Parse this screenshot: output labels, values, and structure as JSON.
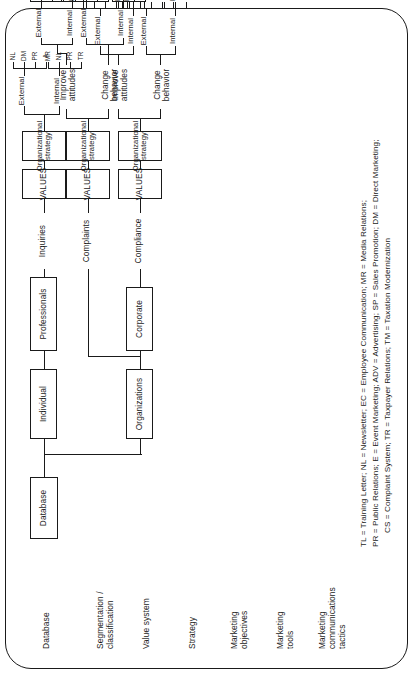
{
  "figure": {
    "orientation": "rotated-90-ccw",
    "row_labels": [
      "Database",
      "Segmentation /\nclassification",
      "Value system",
      "Strategy",
      "Marketing\nobjectives",
      "Marketing\ntools",
      "Marketing\ncommunications\ntactics"
    ]
  },
  "nodes": {
    "database": "Database",
    "organizations": "Organizations",
    "individual": "Individual",
    "corporate": "Corporate",
    "professionals": "Professionals",
    "values": "VALUES",
    "org_strategy": "Organizational\nstrategy"
  },
  "segments": {
    "compliance": "Compliance",
    "complaints": "Complaints",
    "inquiries": "Inquiries"
  },
  "objectives": {
    "change_behavior": "Change\nbehavior",
    "improve_attitudes": "Improve\nattitudes"
  },
  "tools": {
    "internal": "Internal",
    "external": "External"
  },
  "branches": [
    {
      "segment": "Compliance",
      "objectives": [
        {
          "name": "Change\nbehavior",
          "tools": [
            {
              "name": "Internal",
              "tactics": [
                "TL",
                "NL",
                "EC"
              ]
            },
            {
              "name": "External",
              "tactics": [
                "MR",
                "PR",
                "E",
                "A",
                "SP",
                "DM"
              ]
            }
          ]
        },
        {
          "name": "Improve\nattitudes",
          "tools": [
            {
              "name": "Internal",
              "tactics": [
                "TL",
                "NL",
                "EC"
              ]
            },
            {
              "name": "External",
              "tactics": [
                "MR",
                "PR",
                "E",
                "A",
                "SP",
                "DM"
              ]
            }
          ]
        }
      ]
    },
    {
      "segment": "Complaints",
      "objectives": [
        {
          "name": "Change\nbehavior",
          "tools": [
            {
              "name": "Internal",
              "tactics": [
                "CS",
                "TR",
                "EC",
                "TM"
              ]
            },
            {
              "name": "External",
              "tactics": [
                "DM",
                "PR",
                "NL",
                "ADV"
              ]
            }
          ]
        },
        {
          "name": "Improve\nattitudes",
          "tools": [
            {
              "name": "Internal",
              "tactics": [
                "CS",
                "TR",
                "EC"
              ]
            },
            {
              "name": "External",
              "tactics": [
                "A",
                "DM",
                "PR",
                "E"
              ]
            }
          ]
        }
      ]
    },
    {
      "segment": "Inquiries",
      "objectives": [
        {
          "name": "",
          "tools": [
            {
              "name": "Internal",
              "tactics": [
                "TR",
                "PR",
                "NL",
                "MR"
              ]
            },
            {
              "name": "External",
              "tactics": [
                "A",
                "PR",
                "DM",
                "NL"
              ]
            }
          ]
        }
      ]
    }
  ],
  "legend": {
    "line1": "TL = Training Letter; NL = Newsletter; EC = Employee Communication; MR = Media Relations;",
    "line2": "PR = Public Relations; E = Event Marketing; ADV = Advertising; SP = Sales Promotion; DM = Direct Marketing;",
    "line3": "CS = Complaint System; TR = Taxpayer Relations; TM = Taxation Modernization"
  },
  "colors": {
    "ink": "#1a1a1a",
    "paper": "#ffffff"
  }
}
